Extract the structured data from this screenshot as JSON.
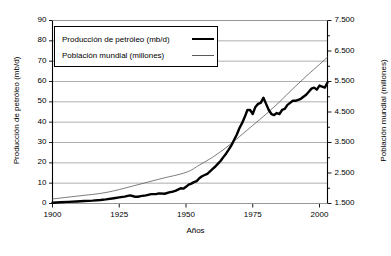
{
  "chart_data": {
    "type": "line",
    "title": "",
    "xlabel": "Años",
    "grid": "horizontal",
    "legend_position": "top-left-inside",
    "x": [
      1900,
      1905,
      1910,
      1915,
      1920,
      1925,
      1930,
      1935,
      1940,
      1945,
      1950,
      1955,
      1960,
      1965,
      1970,
      1975,
      1980,
      1985,
      1990,
      1995,
      2000,
      2003
    ],
    "xlim": [
      1900,
      2003
    ],
    "xticks": [
      1900,
      1925,
      1950,
      1975,
      2000
    ],
    "xtick_labels": [
      "1900",
      "1925",
      "1950",
      "1975",
      "2000"
    ],
    "axes": [
      {
        "side": "left",
        "label": "Producción de petróleo (mb/d)",
        "lim": [
          0,
          90
        ],
        "ticks": [
          0,
          10,
          20,
          30,
          40,
          50,
          60,
          70,
          80,
          90
        ],
        "tick_labels": [
          "0",
          "10",
          "20",
          "30",
          "40",
          "50",
          "60",
          "70",
          "80",
          "90"
        ]
      },
      {
        "side": "right",
        "label": "Población mundial (millones)",
        "lim": [
          1500,
          7500
        ],
        "ticks": [
          1500,
          2000,
          2500,
          3000,
          3500,
          4000,
          4500,
          5000,
          5500,
          6000,
          6500,
          7000,
          7500
        ],
        "major_ticks": [
          1500,
          2500,
          3500,
          4500,
          5500,
          6500,
          7500
        ],
        "tick_labels": [
          "1.500",
          "2.500",
          "3.500",
          "4.500",
          "5.500",
          "6.500",
          "7.500"
        ]
      }
    ],
    "series": [
      {
        "name": "Producción de petróleo (mb/d)",
        "axis": "left",
        "color": "#000000",
        "width": 2.4,
        "unit": "mb/d",
        "points": [
          [
            1900,
            0.4
          ],
          [
            1903,
            0.6
          ],
          [
            1906,
            0.8
          ],
          [
            1909,
            1.0
          ],
          [
            1912,
            1.2
          ],
          [
            1915,
            1.4
          ],
          [
            1918,
            1.7
          ],
          [
            1920,
            2.0
          ],
          [
            1923,
            2.6
          ],
          [
            1925,
            3.0
          ],
          [
            1927,
            3.4
          ],
          [
            1929,
            4.0
          ],
          [
            1930,
            3.7
          ],
          [
            1931,
            3.3
          ],
          [
            1932,
            3.3
          ],
          [
            1933,
            3.6
          ],
          [
            1935,
            4.0
          ],
          [
            1937,
            4.6
          ],
          [
            1939,
            4.7
          ],
          [
            1940,
            5.0
          ],
          [
            1942,
            4.8
          ],
          [
            1944,
            5.6
          ],
          [
            1945,
            5.8
          ],
          [
            1946,
            6.2
          ],
          [
            1947,
            6.8
          ],
          [
            1948,
            7.5
          ],
          [
            1949,
            7.3
          ],
          [
            1950,
            8.2
          ],
          [
            1951,
            9.3
          ],
          [
            1952,
            9.8
          ],
          [
            1953,
            10.5
          ],
          [
            1954,
            11.0
          ],
          [
            1955,
            12.4
          ],
          [
            1956,
            13.4
          ],
          [
            1957,
            14.0
          ],
          [
            1958,
            14.6
          ],
          [
            1959,
            15.8
          ],
          [
            1960,
            17.0
          ],
          [
            1961,
            18.2
          ],
          [
            1962,
            19.6
          ],
          [
            1963,
            21.0
          ],
          [
            1964,
            22.8
          ],
          [
            1965,
            24.5
          ],
          [
            1966,
            26.5
          ],
          [
            1967,
            28.6
          ],
          [
            1968,
            31.2
          ],
          [
            1969,
            33.8
          ],
          [
            1970,
            37.0
          ],
          [
            1971,
            39.5
          ],
          [
            1972,
            42.5
          ],
          [
            1973,
            46.0
          ],
          [
            1974,
            46.0
          ],
          [
            1975,
            44.0
          ],
          [
            1976,
            47.5
          ],
          [
            1977,
            49.0
          ],
          [
            1978,
            49.5
          ],
          [
            1979,
            52.0
          ],
          [
            1980,
            49.0
          ],
          [
            1981,
            46.0
          ],
          [
            1982,
            44.0
          ],
          [
            1983,
            43.5
          ],
          [
            1984,
            44.5
          ],
          [
            1985,
            44.0
          ],
          [
            1986,
            46.0
          ],
          [
            1987,
            46.5
          ],
          [
            1988,
            48.5
          ],
          [
            1989,
            49.5
          ],
          [
            1990,
            50.5
          ],
          [
            1991,
            50.5
          ],
          [
            1992,
            51.0
          ],
          [
            1993,
            51.5
          ],
          [
            1994,
            52.5
          ],
          [
            1995,
            53.5
          ],
          [
            1996,
            55.0
          ],
          [
            1997,
            56.5
          ],
          [
            1998,
            57.0
          ],
          [
            1999,
            56.0
          ],
          [
            2000,
            58.0
          ],
          [
            2001,
            57.5
          ],
          [
            2002,
            57.0
          ],
          [
            2003,
            59.5
          ]
        ]
      },
      {
        "name": "Población mundial (millones)",
        "axis": "right",
        "color": "#5a5a5a",
        "width": 0.8,
        "unit": "millones",
        "points": [
          [
            1900,
            1650
          ],
          [
            1910,
            1750
          ],
          [
            1920,
            1860
          ],
          [
            1930,
            2070
          ],
          [
            1940,
            2300
          ],
          [
            1950,
            2520
          ],
          [
            1955,
            2760
          ],
          [
            1960,
            3020
          ],
          [
            1965,
            3330
          ],
          [
            1970,
            3690
          ],
          [
            1975,
            4060
          ],
          [
            1980,
            4430
          ],
          [
            1985,
            4830
          ],
          [
            1990,
            5260
          ],
          [
            1995,
            5670
          ],
          [
            2000,
            6060
          ],
          [
            2003,
            6300
          ]
        ]
      }
    ]
  },
  "legend": {
    "items": [
      {
        "label": "Producción de petróleo (mb/d)",
        "style": "thick"
      },
      {
        "label": "Población mundial (millones)",
        "style": "thin"
      }
    ]
  },
  "labels": {
    "x_axis_title": "Años",
    "y_left_title": "Producción de petróleo (mb/d)",
    "y_right_title": "Población mundial (millones)"
  }
}
